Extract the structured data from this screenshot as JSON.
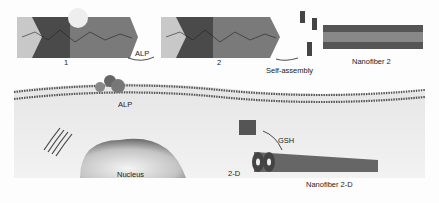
{
  "diagram": {
    "molecules": [
      {
        "id": "1",
        "label": "1"
      },
      {
        "id": "2",
        "label": "2"
      }
    ],
    "arrows": [
      {
        "from": "1",
        "to": "2",
        "label": "ALP"
      },
      {
        "from": "2",
        "to": "nanofiber-2",
        "label": "Self-assembly"
      },
      {
        "from": "2-D",
        "to": "nanofiber-2-D",
        "label": "GSH"
      }
    ],
    "labels": {
      "compound1": "1",
      "compound2": "2",
      "alp_arrow": "ALP",
      "self_assembly": "Self-assembly",
      "nanofiber2": "Nanofiber 2",
      "alp_enzyme": "ALP",
      "nucleus": "Nucleus",
      "gsh": "GSH",
      "compound2d": "2-D",
      "nanofiber2d": "Nanofiber 2-D"
    },
    "colors": {
      "dark_block": "#4a4a4a",
      "mid_block": "#7a7a7a",
      "light_block": "#c8c8c8",
      "membrane": "#555555",
      "cell_interior": "#ebebeb",
      "nucleus": "#9a9a9a"
    }
  }
}
